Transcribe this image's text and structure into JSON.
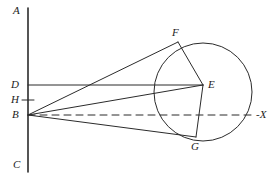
{
  "figure": {
    "type": "geometric-diagram",
    "background_color": "#ffffff",
    "stroke_color": "#2b2b2b",
    "label_color": "#1c1c1c",
    "width": 277,
    "height": 185
  },
  "labels": {
    "a": "A",
    "c": "C",
    "d": "D",
    "h": "H",
    "b": "B",
    "e": "E",
    "f": "F",
    "g": "G",
    "x_axis": "-X"
  },
  "points": {
    "A": {
      "x": 28,
      "y": 8
    },
    "C": {
      "x": 28,
      "y": 172
    },
    "D": {
      "x": 28,
      "y": 85
    },
    "H": {
      "x": 28,
      "y": 100
    },
    "B": {
      "x": 28,
      "y": 115
    },
    "E": {
      "x": 203,
      "y": 85
    },
    "F": {
      "x": 178,
      "y": 42
    },
    "G": {
      "x": 196,
      "y": 137
    }
  },
  "circle": {
    "center_x": 203,
    "center_y": 92,
    "radius": 49
  },
  "segments": [
    {
      "name": "axis-AC",
      "x1": 28,
      "y1": 8,
      "x2": 28,
      "y2": 172,
      "style": "solid",
      "width": 1.6
    },
    {
      "name": "tick-H",
      "x1": 22,
      "y1": 100,
      "x2": 34,
      "y2": 100,
      "style": "solid",
      "width": 1
    },
    {
      "name": "line-DE",
      "x1": 28,
      "y1": 85,
      "x2": 203,
      "y2": 85,
      "style": "solid",
      "width": 1
    },
    {
      "name": "line-BF",
      "x1": 28,
      "y1": 115,
      "x2": 178,
      "y2": 42,
      "style": "solid",
      "width": 1
    },
    {
      "name": "line-BE",
      "x1": 28,
      "y1": 115,
      "x2": 203,
      "y2": 85,
      "style": "solid",
      "width": 1
    },
    {
      "name": "line-BG",
      "x1": 28,
      "y1": 115,
      "x2": 196,
      "y2": 137,
      "style": "solid",
      "width": 1
    },
    {
      "name": "axis-BX",
      "x1": 28,
      "y1": 115,
      "x2": 256,
      "y2": 115,
      "style": "dashed",
      "width": 1
    },
    {
      "name": "chord-FE",
      "x1": 178,
      "y1": 42,
      "x2": 203,
      "y2": 85,
      "style": "solid",
      "width": 1
    },
    {
      "name": "chord-EG",
      "x1": 203,
      "y1": 85,
      "x2": 196,
      "y2": 137,
      "style": "solid",
      "width": 1
    }
  ],
  "label_positions": {
    "A": {
      "left": 13,
      "top": 5
    },
    "C": {
      "left": 13,
      "top": 159
    },
    "D": {
      "left": 11,
      "top": 79
    },
    "H": {
      "left": 11,
      "top": 94
    },
    "B": {
      "left": 12,
      "top": 109
    },
    "E": {
      "left": 208,
      "top": 79
    },
    "F": {
      "left": 172,
      "top": 27
    },
    "G": {
      "left": 191,
      "top": 141
    },
    "X": {
      "left": 256,
      "top": 109
    }
  }
}
